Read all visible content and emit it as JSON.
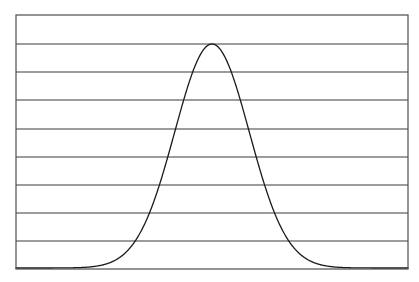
{
  "figure": {
    "background_color": "#ffffff",
    "width": 419,
    "height": 282
  },
  "plot_frame": {
    "name": "plot-frame",
    "left": 16,
    "top": 15,
    "right": 408,
    "bottom": 269,
    "border_color": "#4d4d4d",
    "border_width": 1.2,
    "fill_color": "#ffffff"
  },
  "gridlines": {
    "orientation": "horizontal",
    "color": "#3a3a3a",
    "width": 1.2,
    "count": 8,
    "y_pixels": [
      44,
      72,
      100,
      129,
      157,
      185,
      213,
      241
    ]
  },
  "curve": {
    "name": "bell-curve",
    "color": "#1a1a1a",
    "width": 1.3,
    "fill": "none",
    "peak_x": 215,
    "peak_y": 44,
    "baseline_y": 268,
    "sigma_px": 38
  },
  "labels": {
    "title": "",
    "xlabel": "",
    "ylabel": "",
    "xticks": [],
    "yticks": [],
    "legend": []
  },
  "chart_data": {
    "type": "line",
    "title": "",
    "subtitle": "",
    "xlabel": "",
    "ylabel": "",
    "grid": true,
    "grid_axis": "y",
    "legend": [],
    "legend_position": "none",
    "xlim": [
      -5.25,
      5.25
    ],
    "ylim": [
      0,
      1.1
    ],
    "xticks": [],
    "yticks": [
      0.0,
      0.1222,
      0.2444,
      0.3667,
      0.4889,
      0.6111,
      0.7333,
      0.8556,
      0.9778
    ],
    "annotations": [],
    "series": [
      {
        "name": "normal-distribution",
        "distribution": "gaussian",
        "mean": 0,
        "sigma": 1.0,
        "peak_value": 1.0,
        "color": "#1a1a1a",
        "x": [
          -5.25,
          -5.0,
          -4.75,
          -4.5,
          -4.25,
          -4.0,
          -3.75,
          -3.5,
          -3.25,
          -3.0,
          -2.75,
          -2.5,
          -2.25,
          -2.0,
          -1.75,
          -1.5,
          -1.25,
          -1.0,
          -0.75,
          -0.5,
          -0.25,
          0.0,
          0.25,
          0.5,
          0.75,
          1.0,
          1.25,
          1.5,
          1.75,
          2.0,
          2.25,
          2.5,
          2.75,
          3.0,
          3.25,
          3.5,
          3.75,
          4.0,
          4.25,
          4.5,
          4.75,
          5.0,
          5.25
        ],
        "y": [
          0.0,
          0.0,
          0.0,
          0.0,
          0.0,
          0.0,
          0.001,
          0.002,
          0.005,
          0.011,
          0.023,
          0.044,
          0.079,
          0.135,
          0.216,
          0.325,
          0.458,
          0.607,
          0.755,
          0.882,
          0.97,
          1.0,
          0.97,
          0.882,
          0.755,
          0.607,
          0.458,
          0.325,
          0.216,
          0.135,
          0.079,
          0.044,
          0.023,
          0.011,
          0.005,
          0.002,
          0.001,
          0.0,
          0.0,
          0.0,
          0.0,
          0.0,
          0.0
        ]
      }
    ]
  }
}
